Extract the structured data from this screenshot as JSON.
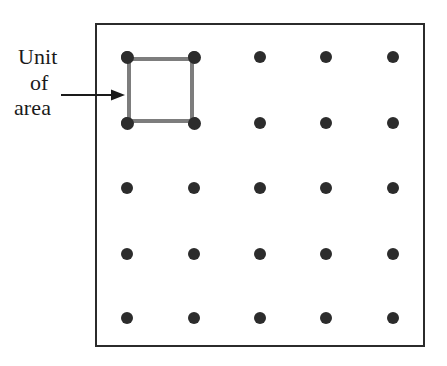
{
  "figure": {
    "background_color": "#ffffff",
    "frame": {
      "x": 95,
      "y": 23,
      "width": 330,
      "height": 324,
      "border_color": "#2b2b2b",
      "border_width": 2
    },
    "callout": {
      "lines": [
        "Unit",
        "of",
        "area"
      ],
      "full_text": "Unit of area",
      "font_size": 22,
      "color": "#1a1a1a",
      "arrow": {
        "direction": "right",
        "x1": 61,
        "y1": 95,
        "x2": 125,
        "y2": 95,
        "color": "#1a1a1a"
      }
    },
    "lattice": {
      "rows": 5,
      "columns": 5,
      "dot_count": 25,
      "dot_color": "#2c2c2c",
      "dot_diameter": 12,
      "column_x": [
        127,
        194,
        260,
        326,
        393
      ],
      "row_y": [
        57,
        123,
        188,
        254,
        318
      ],
      "dots": [
        {
          "col": 1,
          "row": 1,
          "x": 127,
          "y": 57
        },
        {
          "col": 2,
          "row": 1,
          "x": 194,
          "y": 57
        },
        {
          "col": 3,
          "row": 1,
          "x": 260,
          "y": 57
        },
        {
          "col": 4,
          "row": 1,
          "x": 326,
          "y": 57
        },
        {
          "col": 5,
          "row": 1,
          "x": 393,
          "y": 57
        },
        {
          "col": 1,
          "row": 2,
          "x": 127,
          "y": 123
        },
        {
          "col": 2,
          "row": 2,
          "x": 194,
          "y": 123
        },
        {
          "col": 3,
          "row": 2,
          "x": 260,
          "y": 123
        },
        {
          "col": 4,
          "row": 2,
          "x": 326,
          "y": 123
        },
        {
          "col": 5,
          "row": 2,
          "x": 393,
          "y": 123
        },
        {
          "col": 1,
          "row": 3,
          "x": 127,
          "y": 188
        },
        {
          "col": 2,
          "row": 3,
          "x": 194,
          "y": 188
        },
        {
          "col": 3,
          "row": 3,
          "x": 260,
          "y": 188
        },
        {
          "col": 4,
          "row": 3,
          "x": 326,
          "y": 188
        },
        {
          "col": 5,
          "row": 3,
          "x": 393,
          "y": 188
        },
        {
          "col": 1,
          "row": 4,
          "x": 127,
          "y": 254
        },
        {
          "col": 2,
          "row": 4,
          "x": 194,
          "y": 254
        },
        {
          "col": 3,
          "row": 4,
          "x": 260,
          "y": 254
        },
        {
          "col": 4,
          "row": 4,
          "x": 326,
          "y": 254
        },
        {
          "col": 5,
          "row": 4,
          "x": 393,
          "y": 254
        },
        {
          "col": 1,
          "row": 5,
          "x": 127,
          "y": 318
        },
        {
          "col": 2,
          "row": 5,
          "x": 194,
          "y": 318
        },
        {
          "col": 3,
          "row": 5,
          "x": 260,
          "y": 318
        },
        {
          "col": 4,
          "row": 5,
          "x": 326,
          "y": 318
        },
        {
          "col": 5,
          "row": 5,
          "x": 393,
          "y": 318
        }
      ]
    },
    "unit_square": {
      "x": 127,
      "y": 57,
      "width": 67,
      "height": 66,
      "stroke_color": "#7d7d7d",
      "stroke_width": 4,
      "fill": "none",
      "corners": [
        {
          "x": 127,
          "y": 57
        },
        {
          "x": 194,
          "y": 57
        },
        {
          "x": 127,
          "y": 123
        },
        {
          "x": 194,
          "y": 123
        }
      ]
    }
  }
}
